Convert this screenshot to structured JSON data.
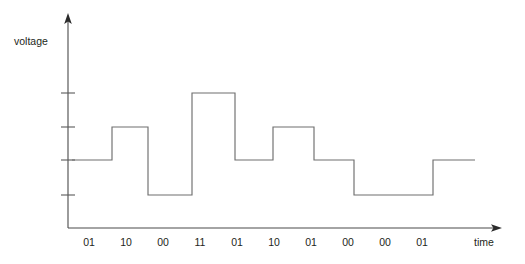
{
  "figure": {
    "background_color": "#ffffff",
    "line_color": "#6e6e6e",
    "axis_color": "#4a4a4a",
    "text_color": "#231f20"
  },
  "axes": {
    "y_axis_label": "voltage",
    "x_axis_label": "time",
    "y_axis_x": 68,
    "y_axis_top": 14,
    "x_axis_y": 228,
    "x_axis_right": 501,
    "y_tick_values": [
      93,
      127,
      160,
      195
    ],
    "y_tick_count": 4,
    "y_tick_half_width": 7
  },
  "chart_data": {
    "type": "line",
    "title": "",
    "subtitle": "",
    "xlabel": "time",
    "ylabel": "voltage",
    "grid": false,
    "legend": null,
    "step_style": "post",
    "level_names": [
      "00",
      "01",
      "10",
      "11"
    ],
    "level_pixel_y": {
      "00": 195,
      "01": 160,
      "10": 127,
      "11": 93
    },
    "categories": [
      "01",
      "10",
      "00",
      "11",
      "01",
      "10",
      "01",
      "00",
      "00",
      "01"
    ],
    "values": [
      1,
      2,
      0,
      3,
      1,
      2,
      1,
      0,
      0,
      1
    ],
    "symbols": [
      "01",
      "10",
      "00",
      "11",
      "01",
      "10",
      "01",
      "00",
      "00",
      "01"
    ],
    "ylim": [
      0,
      3
    ],
    "x_tick_labels": [
      "01",
      "10",
      "00",
      "11",
      "01",
      "10",
      "01",
      "00",
      "00",
      "01"
    ],
    "x_tick_label_x": [
      89,
      126,
      163,
      200,
      237,
      274,
      311,
      348,
      385,
      422
    ],
    "x_tick_label_y": 246,
    "segment_boundaries_x": [
      72,
      112,
      148,
      192,
      235,
      273,
      314,
      354,
      394,
      433,
      475
    ],
    "annotations": []
  },
  "labels": {
    "voltage": {
      "text": "voltage",
      "x": 14,
      "y": 45
    },
    "time": {
      "text": "time",
      "x": 474,
      "y": 246
    }
  }
}
